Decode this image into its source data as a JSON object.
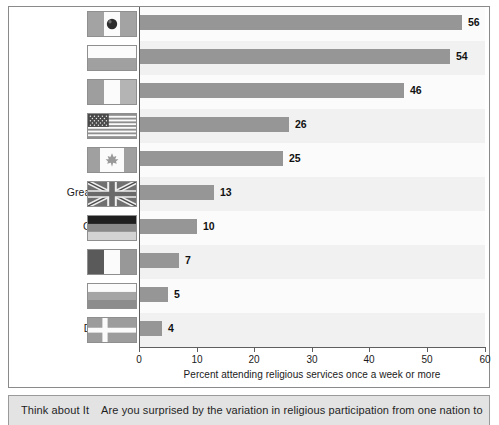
{
  "chart_data": {
    "type": "bar",
    "orientation": "horizontal",
    "title": "",
    "xlabel": "Percent attending religious services once a week or more",
    "ylabel": "",
    "xlim": [
      0,
      60
    ],
    "xticks": [
      0,
      10,
      20,
      30,
      40,
      50,
      60
    ],
    "grid": false,
    "legend": "none",
    "categories": [
      "Mexico",
      "Poland",
      "Ireland",
      "U.S.A.",
      "Canada",
      "Great Britain",
      "Germany",
      "France",
      "Russia",
      "Denmark"
    ],
    "values": [
      56,
      54,
      46,
      26,
      25,
      13,
      10,
      7,
      5,
      4
    ],
    "bar_color": "#969696",
    "rows": [
      {
        "label": "Mexico",
        "value": 56,
        "value_text": "56",
        "flag": "flag-mexico"
      },
      {
        "label": "Poland",
        "value": 54,
        "value_text": "54",
        "flag": "flag-poland"
      },
      {
        "label": "Ireland",
        "value": 46,
        "value_text": "46",
        "flag": "flag-ireland"
      },
      {
        "label": "U.S.A.",
        "value": 26,
        "value_text": "26",
        "flag": "flag-usa"
      },
      {
        "label": "Canada",
        "value": 25,
        "value_text": "25",
        "flag": "flag-canada"
      },
      {
        "label": "Great Britain",
        "value": 13,
        "value_text": "13",
        "flag": "flag-great-britain"
      },
      {
        "label": "Germany",
        "value": 10,
        "value_text": "10",
        "flag": "flag-germany"
      },
      {
        "label": "France",
        "value": 7,
        "value_text": "7",
        "flag": "flag-france"
      },
      {
        "label": "Russia",
        "value": 5,
        "value_text": "5",
        "flag": "flag-russia"
      },
      {
        "label": "Denmark",
        "value": 4,
        "value_text": "4",
        "flag": "flag-denmark"
      }
    ]
  },
  "axis": {
    "tick_labels": [
      "0",
      "10",
      "20",
      "30",
      "40",
      "50",
      "60"
    ],
    "title": "Percent attending religious services once a week or more"
  },
  "caption": {
    "lead": "Think about It",
    "body": "Are you surprised by the variation in religious participation from one nation to",
    "full": "Think about It  Are you surprised by the variation in religious participation from one nation to"
  },
  "colors": {
    "bar": "#969696",
    "band_light": "#fbfbfb",
    "band_alt": "#f1f1f1",
    "axis": "#5f5f5f",
    "frame": "#8a8a8a",
    "caption_bg": "#e3e3e3"
  }
}
